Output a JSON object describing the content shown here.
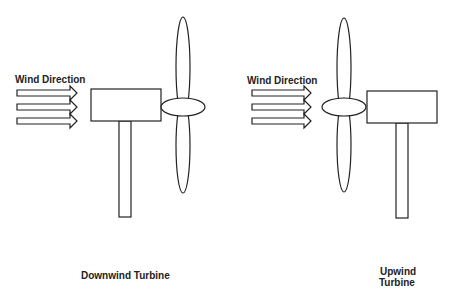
{
  "diagram": {
    "downwind": {
      "wind_label": "Wind Direction",
      "caption": "Downwind Turbine"
    },
    "upwind": {
      "wind_label": "Wind Direction",
      "caption_line1": "Upwind",
      "caption_line2": "Turbine"
    },
    "colors": {
      "stroke": "#222222",
      "background": "#ffffff"
    }
  }
}
